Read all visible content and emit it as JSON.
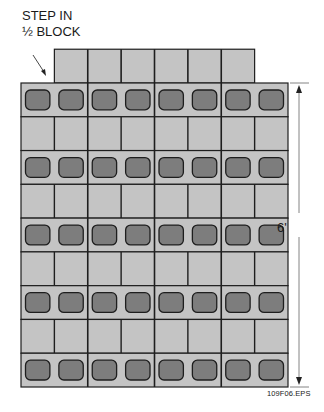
{
  "callout": {
    "line1": "STEP IN",
    "line2": "½ BLOCK"
  },
  "dimension": {
    "label": "6'"
  },
  "figure_id": "109F06.EPS",
  "wall": {
    "courses": 9,
    "blocks_per_course": 4,
    "step_course": {
      "position": "top",
      "offset_half_blocks": 1,
      "length_half_blocks": 6
    }
  },
  "colors": {
    "block_face": "#c4c4c4",
    "core": "#7d7d7d",
    "mortar_line": "#1e1e1e",
    "dimension_line": "#555555"
  }
}
